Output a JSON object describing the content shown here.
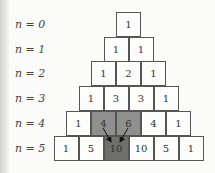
{
  "diagram": {
    "row_labels": [
      "n = 0",
      "n = 1",
      "n = 2",
      "n = 3",
      "n = 4",
      "n = 5"
    ],
    "rows": [
      [
        "1"
      ],
      [
        "1",
        "1"
      ],
      [
        "1",
        "2",
        "1"
      ],
      [
        "1",
        "3",
        "3",
        "1"
      ],
      [
        "1",
        "4",
        "6",
        "4",
        "1"
      ],
      [
        "1",
        "5",
        "10",
        "10",
        "5",
        "1"
      ]
    ],
    "highlight": {
      "sources": [
        {
          "row": 4,
          "col": 1,
          "value": "4"
        },
        {
          "row": 4,
          "col": 2,
          "value": "6"
        }
      ],
      "target": {
        "row": 5,
        "col": 2,
        "value": "10"
      },
      "source_color": "#8f8f8d",
      "target_color": "#6f6f6d"
    }
  }
}
